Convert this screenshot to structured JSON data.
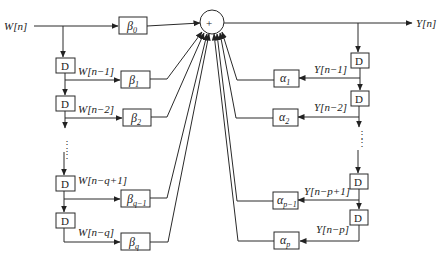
{
  "diagram": {
    "type": "ARMA filter block diagram (direct form)",
    "input_label": "W[n]",
    "output_label": "Y[n]",
    "summer_symbol": "+",
    "delay_label": "D",
    "feedforward": {
      "taps": [
        {
          "signal": "",
          "coef": "β",
          "sub": "0"
        },
        {
          "signal": "W[n−1]",
          "coef": "β",
          "sub": "1"
        },
        {
          "signal": "W[n−2]",
          "coef": "β",
          "sub": "2"
        },
        {
          "signal": "W[n−q+1]",
          "coef": "β",
          "sub": "q−1"
        },
        {
          "signal": "W[n−q]",
          "coef": "β",
          "sub": "q"
        }
      ]
    },
    "feedback": {
      "taps": [
        {
          "signal": "Y[n−1]",
          "coef": "α",
          "sub": "1"
        },
        {
          "signal": "Y[n−2]",
          "coef": "α",
          "sub": "2"
        },
        {
          "signal": "Y[n−p+1]",
          "coef": "α",
          "sub": "p−1"
        },
        {
          "signal": "Y[n−p]",
          "coef": "α",
          "sub": "p"
        }
      ]
    },
    "ellipsis": "⋮"
  }
}
